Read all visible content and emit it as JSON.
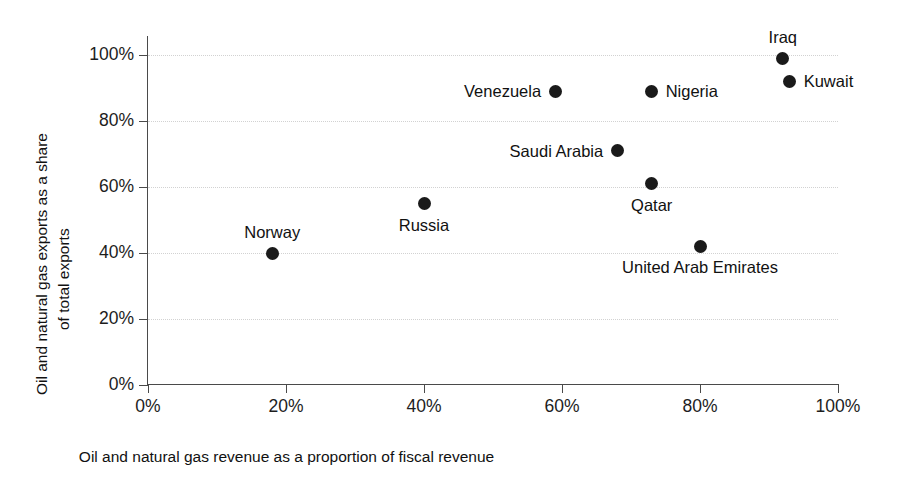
{
  "chart_data": {
    "type": "scatter",
    "title": "",
    "xlabel": "Oil and natural gas revenue as a proportion of fiscal revenue",
    "ylabel": "Oil and natural gas exports as a share of total exports",
    "ylabel_lines": [
      "Oil and natural gas exports as a share",
      "of total exports"
    ],
    "xlim": [
      0,
      100
    ],
    "ylim": [
      0,
      100
    ],
    "xticks": [
      "0%",
      "20%",
      "40%",
      "60%",
      "80%",
      "100%"
    ],
    "yticks": [
      "0%",
      "20%",
      "40%",
      "60%",
      "80%",
      "100%"
    ],
    "xtick_values": [
      0,
      20,
      40,
      60,
      80,
      100
    ],
    "ytick_values": [
      0,
      20,
      40,
      60,
      80,
      100
    ],
    "grid": "horizontal-dotted",
    "legend": "none",
    "marker_color": "#1a1a1a",
    "axis_color": "#4a4a4a",
    "grid_color": "#d2d2d2",
    "points": [
      {
        "name": "Norway",
        "x": 18,
        "y": 40,
        "label_pos": "above"
      },
      {
        "name": "Russia",
        "x": 40,
        "y": 55,
        "label_pos": "below"
      },
      {
        "name": "Venezuela",
        "x": 59,
        "y": 89,
        "label_pos": "left"
      },
      {
        "name": "Saudi Arabia",
        "x": 68,
        "y": 71,
        "label_pos": "left"
      },
      {
        "name": "Nigeria",
        "x": 73,
        "y": 89,
        "label_pos": "right"
      },
      {
        "name": "Qatar",
        "x": 73,
        "y": 61,
        "label_pos": "below"
      },
      {
        "name": "United Arab Emirates",
        "x": 80,
        "y": 42,
        "label_pos": "below"
      },
      {
        "name": "Iraq",
        "x": 92,
        "y": 99,
        "label_pos": "above"
      },
      {
        "name": "Kuwait",
        "x": 93,
        "y": 92,
        "label_pos": "right"
      }
    ]
  }
}
